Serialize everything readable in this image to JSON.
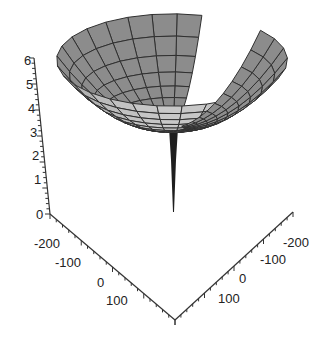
{
  "chart_data": {
    "type": "surface3d",
    "title": "",
    "z_axis": {
      "label": "",
      "ticks": [
        "0",
        "1",
        "2",
        "3",
        "4",
        "5",
        "6"
      ],
      "range": [
        0,
        6
      ]
    },
    "x_axis": {
      "label": "",
      "ticks": [
        "-200",
        "-100",
        "0",
        "100"
      ],
      "range": [
        -250,
        150
      ]
    },
    "y_axis": {
      "label": "",
      "ticks": [
        "-200",
        "-100",
        "0",
        "100"
      ],
      "range": [
        -250,
        150
      ]
    },
    "surface": {
      "shape": "funnel with cut sector (open spiral)",
      "fill_color": "#9a9a9a",
      "mesh_color": "#303030",
      "radial_rings": 10,
      "angular_segments": 24,
      "stem": {
        "z_bottom": 0,
        "z_top": 2.5
      }
    },
    "grid": false,
    "legend": null
  },
  "axes_labels": {
    "z": [
      "0",
      "1",
      "2",
      "3",
      "4",
      "5",
      "6"
    ],
    "left": [
      "-200",
      "-100",
      "0",
      "100"
    ],
    "right": [
      "-200",
      "-100",
      "0",
      "100"
    ]
  }
}
